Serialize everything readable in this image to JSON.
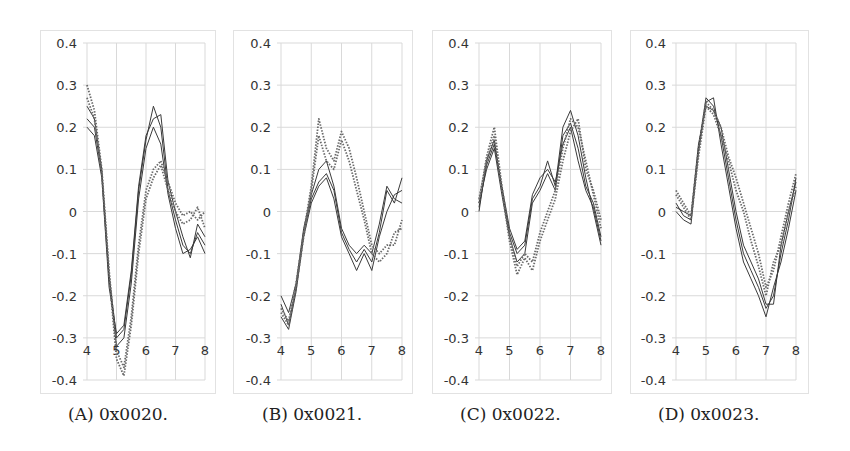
{
  "figure": {
    "panels": [
      {
        "id": "A",
        "caption": "(A) 0x0020."
      },
      {
        "id": "B",
        "caption": "(B) 0x0021."
      },
      {
        "id": "C",
        "caption": "(C) 0x0022."
      },
      {
        "id": "D",
        "caption": "(D) 0x0023."
      }
    ]
  },
  "chart_data": [
    {
      "type": "line",
      "title": "(A) 0x0020.",
      "xlabel": "",
      "ylabel": "",
      "xlim": [
        4,
        8
      ],
      "ylim": [
        -0.4,
        0.4
      ],
      "xticks": [
        4,
        5,
        6,
        7,
        8
      ],
      "yticks": [
        0.4,
        0.3,
        0.2,
        0.1,
        0,
        -0.1,
        -0.2,
        -0.3,
        -0.4
      ],
      "grid": true,
      "x": [
        4.0,
        4.25,
        4.5,
        4.75,
        5.0,
        5.25,
        5.5,
        5.75,
        6.0,
        6.25,
        6.5,
        6.75,
        7.0,
        7.25,
        7.5,
        7.75,
        8.0
      ],
      "series": [
        {
          "name": "solid-1",
          "style": "solid",
          "values": [
            0.25,
            0.22,
            0.1,
            -0.15,
            -0.3,
            -0.28,
            -0.15,
            0.05,
            0.17,
            0.25,
            0.2,
            0.05,
            -0.02,
            -0.08,
            -0.1,
            -0.05,
            -0.08
          ]
        },
        {
          "name": "solid-2",
          "style": "solid",
          "values": [
            0.22,
            0.2,
            0.09,
            -0.16,
            -0.32,
            -0.3,
            -0.17,
            0.03,
            0.15,
            0.2,
            0.16,
            0.04,
            -0.04,
            -0.1,
            -0.09,
            -0.06,
            -0.1
          ]
        },
        {
          "name": "solid-3",
          "style": "solid",
          "values": [
            0.2,
            0.18,
            0.08,
            -0.18,
            -0.29,
            -0.27,
            -0.14,
            0.06,
            0.18,
            0.22,
            0.23,
            0.07,
            0.0,
            -0.06,
            -0.11,
            -0.03,
            -0.06
          ]
        },
        {
          "name": "dotted-1",
          "style": "dotted",
          "values": [
            0.3,
            0.24,
            0.1,
            -0.14,
            -0.33,
            -0.37,
            -0.25,
            -0.08,
            0.05,
            0.1,
            0.12,
            0.07,
            0.02,
            -0.01,
            0.0,
            -0.02,
            0.0
          ]
        },
        {
          "name": "dotted-2",
          "style": "dotted",
          "values": [
            0.27,
            0.22,
            0.09,
            -0.15,
            -0.35,
            -0.39,
            -0.27,
            -0.1,
            0.03,
            0.08,
            0.11,
            0.05,
            0.0,
            -0.03,
            -0.02,
            0.01,
            -0.04
          ]
        }
      ]
    },
    {
      "type": "line",
      "title": "(B) 0x0021.",
      "xlabel": "",
      "ylabel": "",
      "xlim": [
        4,
        8
      ],
      "ylim": [
        -0.4,
        0.4
      ],
      "xticks": [
        4,
        5,
        6,
        7,
        8
      ],
      "yticks": [
        0.4,
        0.3,
        0.2,
        0.1,
        0,
        -0.1,
        -0.2,
        -0.3,
        -0.4
      ],
      "grid": true,
      "x": [
        4.0,
        4.25,
        4.5,
        4.75,
        5.0,
        5.25,
        5.5,
        5.75,
        6.0,
        6.25,
        6.5,
        6.75,
        7.0,
        7.25,
        7.5,
        7.75,
        8.0
      ],
      "series": [
        {
          "name": "solid-1",
          "style": "solid",
          "values": [
            -0.22,
            -0.27,
            -0.18,
            -0.05,
            0.03,
            0.07,
            0.09,
            0.05,
            -0.05,
            -0.09,
            -0.12,
            -0.09,
            -0.12,
            -0.05,
            0.05,
            0.02,
            0.08
          ]
        },
        {
          "name": "solid-2",
          "style": "solid",
          "values": [
            -0.25,
            -0.28,
            -0.19,
            -0.06,
            0.02,
            0.06,
            0.08,
            0.03,
            -0.06,
            -0.1,
            -0.14,
            -0.1,
            -0.14,
            -0.06,
            0.0,
            0.04,
            0.05
          ]
        },
        {
          "name": "solid-3",
          "style": "solid",
          "values": [
            -0.2,
            -0.24,
            -0.17,
            -0.04,
            0.04,
            0.1,
            0.12,
            0.06,
            -0.04,
            -0.08,
            -0.1,
            -0.08,
            -0.1,
            -0.03,
            0.06,
            0.03,
            0.02
          ]
        },
        {
          "name": "dotted-1",
          "style": "dotted",
          "values": [
            -0.23,
            -0.26,
            -0.17,
            -0.05,
            0.06,
            0.22,
            0.15,
            0.12,
            0.19,
            0.15,
            0.08,
            0.0,
            -0.08,
            -0.1,
            -0.08,
            -0.08,
            -0.02
          ]
        },
        {
          "name": "dotted-2",
          "style": "dotted",
          "values": [
            -0.24,
            -0.27,
            -0.18,
            -0.06,
            0.05,
            0.18,
            0.12,
            0.1,
            0.17,
            0.12,
            0.05,
            -0.02,
            -0.1,
            -0.12,
            -0.1,
            -0.05,
            -0.04
          ]
        }
      ]
    },
    {
      "type": "line",
      "title": "(C) 0x0022.",
      "xlabel": "",
      "ylabel": "",
      "xlim": [
        4,
        8
      ],
      "ylim": [
        -0.4,
        0.4
      ],
      "xticks": [
        4,
        5,
        6,
        7,
        8
      ],
      "yticks": [
        0.4,
        0.3,
        0.2,
        0.1,
        0,
        -0.1,
        -0.2,
        -0.3,
        -0.4
      ],
      "grid": true,
      "x": [
        4.0,
        4.25,
        4.5,
        4.75,
        5.0,
        5.25,
        5.5,
        5.75,
        6.0,
        6.25,
        6.5,
        6.75,
        7.0,
        7.25,
        7.5,
        7.75,
        8.0
      ],
      "series": [
        {
          "name": "solid-1",
          "style": "solid",
          "values": [
            0.0,
            0.12,
            0.17,
            0.05,
            -0.05,
            -0.1,
            -0.08,
            0.03,
            0.06,
            0.12,
            0.06,
            0.2,
            0.24,
            0.18,
            0.08,
            0.0,
            -0.08
          ]
        },
        {
          "name": "solid-2",
          "style": "solid",
          "values": [
            0.02,
            0.1,
            0.15,
            0.04,
            -0.06,
            -0.12,
            -0.1,
            0.02,
            0.05,
            0.09,
            0.05,
            0.18,
            0.21,
            0.15,
            0.06,
            0.02,
            -0.06
          ]
        },
        {
          "name": "solid-3",
          "style": "solid",
          "values": [
            0.01,
            0.11,
            0.16,
            0.06,
            -0.04,
            -0.09,
            -0.07,
            0.04,
            0.08,
            0.1,
            0.07,
            0.16,
            0.2,
            0.12,
            0.05,
            0.01,
            -0.07
          ]
        },
        {
          "name": "dotted-1",
          "style": "dotted",
          "values": [
            0.02,
            0.13,
            0.2,
            0.06,
            -0.06,
            -0.13,
            -0.1,
            -0.12,
            -0.05,
            0.0,
            0.05,
            0.15,
            0.22,
            0.2,
            0.12,
            0.04,
            -0.04
          ]
        },
        {
          "name": "dotted-2",
          "style": "dotted",
          "values": [
            0.03,
            0.12,
            0.18,
            0.05,
            -0.07,
            -0.15,
            -0.11,
            -0.14,
            -0.07,
            -0.02,
            0.03,
            0.12,
            0.19,
            0.22,
            0.1,
            0.05,
            -0.02
          ]
        }
      ]
    },
    {
      "type": "line",
      "title": "(D) 0x0023.",
      "xlabel": "",
      "ylabel": "",
      "xlim": [
        4,
        8
      ],
      "ylim": [
        -0.4,
        0.4
      ],
      "xticks": [
        4,
        5,
        6,
        7,
        8
      ],
      "yticks": [
        0.4,
        0.3,
        0.2,
        0.1,
        0,
        -0.1,
        -0.2,
        -0.3,
        -0.4
      ],
      "grid": true,
      "x": [
        4.0,
        4.25,
        4.5,
        4.75,
        5.0,
        5.25,
        5.5,
        5.75,
        6.0,
        6.25,
        6.5,
        6.75,
        7.0,
        7.25,
        7.5,
        7.75,
        8.0
      ],
      "series": [
        {
          "name": "solid-1",
          "style": "solid",
          "values": [
            0.02,
            -0.01,
            -0.02,
            0.15,
            0.27,
            0.25,
            0.18,
            0.08,
            -0.02,
            -0.1,
            -0.14,
            -0.18,
            -0.23,
            -0.2,
            -0.1,
            -0.02,
            0.08
          ]
        },
        {
          "name": "solid-2",
          "style": "solid",
          "values": [
            0.0,
            -0.02,
            -0.03,
            0.14,
            0.26,
            0.27,
            0.16,
            0.06,
            -0.04,
            -0.12,
            -0.16,
            -0.2,
            -0.25,
            -0.18,
            -0.12,
            -0.04,
            0.05
          ]
        },
        {
          "name": "solid-3",
          "style": "solid",
          "values": [
            0.01,
            0.0,
            -0.01,
            0.16,
            0.25,
            0.24,
            0.2,
            0.1,
            0.0,
            -0.08,
            -0.12,
            -0.16,
            -0.22,
            -0.22,
            -0.08,
            0.0,
            0.07
          ]
        },
        {
          "name": "dotted-1",
          "style": "dotted",
          "values": [
            0.05,
            0.02,
            -0.01,
            0.15,
            0.26,
            0.24,
            0.2,
            0.13,
            0.08,
            0.02,
            -0.04,
            -0.1,
            -0.18,
            -0.14,
            -0.06,
            0.02,
            0.09
          ]
        },
        {
          "name": "dotted-2",
          "style": "dotted",
          "values": [
            0.04,
            0.01,
            -0.02,
            0.13,
            0.25,
            0.23,
            0.18,
            0.12,
            0.05,
            0.0,
            -0.07,
            -0.13,
            -0.2,
            -0.12,
            -0.08,
            0.0,
            0.06
          ]
        }
      ]
    }
  ],
  "style": {
    "grid_color": "#d9d9d9",
    "frame_color": "#e2e2e2",
    "solid_color": "#3a3a3a",
    "dotted_color": "#6a6a6a"
  }
}
